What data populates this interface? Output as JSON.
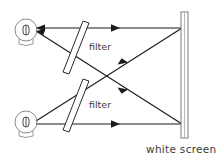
{
  "diagram": {
    "background_color": "#ffffff",
    "ink_color": "#1a1a1a",
    "labels": {
      "filter_top": "filter",
      "filter_bottom": "filter",
      "screen": "white screen"
    },
    "components": {
      "lamp_top": {
        "name": "light-source-top",
        "cx": 26,
        "cy": 30,
        "r": 11
      },
      "lamp_bottom": {
        "name": "light-source-bottom",
        "cx": 26,
        "cy": 122,
        "r": 11
      },
      "filter_top": {
        "name": "filter-top",
        "center_x": 74,
        "center_y": 48,
        "tilt_deg": 20,
        "length": 52,
        "width": 7
      },
      "filter_bottom": {
        "name": "filter-bottom",
        "center_x": 74,
        "center_y": 106,
        "tilt_deg": 20,
        "length": 52,
        "width": 7
      },
      "screen": {
        "name": "white-screen",
        "x": 181,
        "y": 12,
        "width": 6,
        "height": 126
      }
    },
    "rays": [
      {
        "name": "ray-top-straight",
        "from_x": 38,
        "from_y": 28,
        "to_x": 181,
        "to_y": 28,
        "arrow_t": 0.64
      },
      {
        "name": "ray-top-diagonal",
        "from_x": 38,
        "from_y": 32,
        "to_x": 181,
        "to_y": 124,
        "arrow_t": 0.62
      },
      {
        "name": "ray-bottom-straight",
        "from_x": 38,
        "from_y": 124,
        "to_x": 181,
        "to_y": 124,
        "arrow_t": 0.64
      },
      {
        "name": "ray-bottom-diagonal",
        "from_x": 38,
        "from_y": 120,
        "to_x": 181,
        "to_y": 28,
        "arrow_t": 0.62
      }
    ],
    "back_arrows": [
      {
        "name": "arrowhead-toward-top-lamp",
        "x": 38,
        "y": 28,
        "dir": "left"
      },
      {
        "name": "arrowhead-toward-top-lamp-diagonal",
        "x": 38,
        "y": 32,
        "dir": "left-down"
      }
    ],
    "crossing_point": {
      "x": 110,
      "y": 76
    }
  }
}
